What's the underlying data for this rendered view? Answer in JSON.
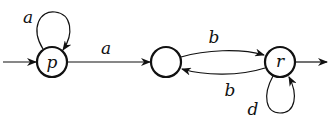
{
  "diagram": {
    "type": "finite-automaton",
    "states": [
      {
        "id": "p",
        "label": "p",
        "initial": true,
        "final": false
      },
      {
        "id": "q",
        "label": "",
        "initial": false,
        "final": false
      },
      {
        "id": "r",
        "label": "r",
        "initial": false,
        "final": true
      }
    ],
    "transitions": [
      {
        "from": "p",
        "to": "p",
        "label": "a"
      },
      {
        "from": "p",
        "to": "q",
        "label": "a"
      },
      {
        "from": "q",
        "to": "r",
        "label": "b"
      },
      {
        "from": "r",
        "to": "q",
        "label": "b"
      },
      {
        "from": "r",
        "to": "r",
        "label": "d"
      }
    ],
    "colors": {
      "stroke": "#111111",
      "background": "#ffffff"
    }
  }
}
